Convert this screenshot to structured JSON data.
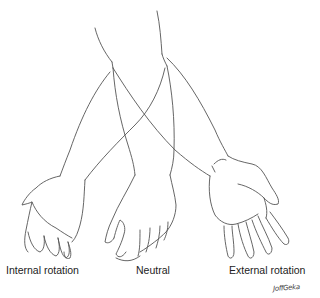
{
  "figure": {
    "labels": {
      "internal": "Internal rotation",
      "neutral": "Neutral",
      "external": "External rotation"
    },
    "signature": "JoffGeka",
    "line_color": "#555555",
    "background": "#ffffff"
  }
}
